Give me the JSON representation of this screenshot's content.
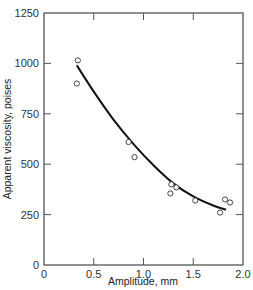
{
  "chart_data": {
    "type": "scatter",
    "title": "",
    "xlabel": "Amplitude, mm",
    "ylabel": "Apparent viscosity, poises",
    "xlim": [
      0,
      2.0
    ],
    "ylim": [
      0,
      1250
    ],
    "x_ticks": [
      0,
      0.5,
      1.0,
      1.5,
      2.0
    ],
    "x_tick_labels": [
      "0",
      "0.5",
      "1.0",
      "1.5",
      "2.0"
    ],
    "y_ticks": [
      0,
      250,
      500,
      750,
      1000,
      1250
    ],
    "y_tick_labels": [
      "0",
      "250",
      "500",
      "750",
      "1000",
      "1250"
    ],
    "grid": false,
    "legend": null,
    "series": [
      {
        "name": "measured",
        "marker": "open-circle",
        "points": [
          {
            "x": 0.34,
            "y": 1015
          },
          {
            "x": 0.33,
            "y": 900
          },
          {
            "x": 0.85,
            "y": 610
          },
          {
            "x": 0.91,
            "y": 535
          },
          {
            "x": 1.28,
            "y": 400
          },
          {
            "x": 1.27,
            "y": 355
          },
          {
            "x": 1.33,
            "y": 385
          },
          {
            "x": 1.52,
            "y": 320
          },
          {
            "x": 1.77,
            "y": 260
          },
          {
            "x": 1.82,
            "y": 325
          },
          {
            "x": 1.87,
            "y": 310
          }
        ]
      },
      {
        "name": "fitted curve",
        "marker": "line",
        "points": [
          {
            "x": 0.33,
            "y": 990
          },
          {
            "x": 0.5,
            "y": 860
          },
          {
            "x": 0.7,
            "y": 720
          },
          {
            "x": 0.9,
            "y": 600
          },
          {
            "x": 1.1,
            "y": 495
          },
          {
            "x": 1.3,
            "y": 405
          },
          {
            "x": 1.5,
            "y": 340
          },
          {
            "x": 1.7,
            "y": 295
          },
          {
            "x": 1.83,
            "y": 275
          }
        ]
      }
    ]
  }
}
